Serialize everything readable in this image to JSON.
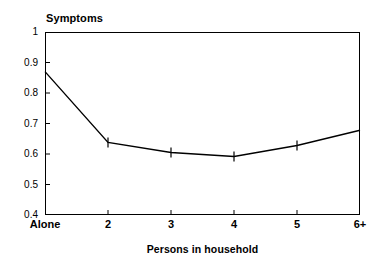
{
  "chart_data": {
    "type": "line",
    "title": "",
    "xlabel": "Persons in household",
    "ylabel": "Symptoms",
    "categories": [
      "Alone",
      "2",
      "3",
      "4",
      "5",
      "6+"
    ],
    "values": [
      0.87,
      0.638,
      0.605,
      0.592,
      0.628,
      0.678
    ],
    "series": [
      {
        "name": "Symptoms",
        "values": [
          0.87,
          0.638,
          0.605,
          0.592,
          0.628,
          0.678
        ]
      }
    ],
    "ylim": [
      0.4,
      1.0
    ],
    "yticks": [
      "0.4",
      "0.5",
      "0.6",
      "0.7",
      "0.8",
      "0.9",
      "1"
    ],
    "ytick_values": [
      0.4,
      0.5,
      0.6,
      0.7,
      0.8,
      0.9,
      1.0
    ],
    "xticks": [
      "Alone",
      "2",
      "3",
      "4",
      "5",
      "6+"
    ],
    "grid": false,
    "legend": "none",
    "markers": "error-bar-tick",
    "marker_points": [
      "2",
      "3",
      "4",
      "5"
    ],
    "line_color": "#000000",
    "axis_color": "#000000",
    "background_color": "#ffffff"
  },
  "axes": {
    "y_title": "Symptoms",
    "x_title": "Persons in household"
  }
}
